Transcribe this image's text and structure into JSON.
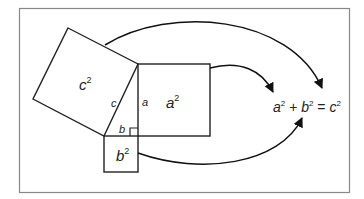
{
  "diagram": {
    "squares": {
      "c_square": "c",
      "a_square": "a",
      "b_square": "b",
      "exponent": "2"
    },
    "sides": {
      "hypotenuse": "c",
      "vertical_leg": "a",
      "horizontal_leg": "b"
    },
    "equation": {
      "a": "a",
      "plus": "+",
      "b": "b",
      "equals": "=",
      "c": "c",
      "exponent": "2"
    },
    "colors": {
      "stroke": "#222222",
      "frame": "#888888",
      "background": "#ffffff"
    }
  }
}
